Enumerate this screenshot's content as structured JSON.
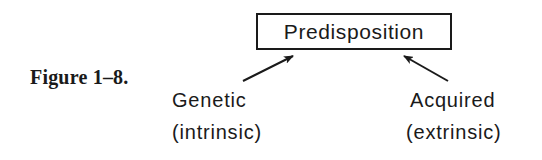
{
  "figure": {
    "label": "Figure 1–8."
  },
  "diagram": {
    "root": {
      "label": "Predisposition"
    },
    "children": [
      {
        "label": "Genetic",
        "sublabel": "(intrinsic)",
        "arrow_to": "root"
      },
      {
        "label": "Acquired",
        "sublabel": "(extrinsic)",
        "arrow_to": "root"
      }
    ],
    "colors": {
      "ink": "#1a1a1a",
      "background": "#ffffff"
    }
  }
}
